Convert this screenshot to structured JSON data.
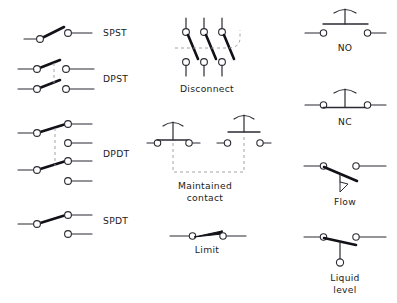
{
  "diagram": {
    "background_color": "#ffffff",
    "line_color": "#2b2b33",
    "blade_color": "#111118",
    "linkage_color": "#9a9aa2",
    "label_color": "#1c1c22",
    "width": 397,
    "height": 303
  },
  "symbols": {
    "spst": {
      "label": "SPST",
      "name": "single-pole-single-throw",
      "poles": 1,
      "throws": 1,
      "state": "open",
      "terminals": 2,
      "label_x": 103,
      "label_y": 33,
      "label_align": "start"
    },
    "dpst": {
      "label": "DPST",
      "name": "double-pole-single-throw",
      "poles": 2,
      "throws": 1,
      "state": "open",
      "terminals": 4,
      "linkage": "dashed",
      "label_x": 103,
      "label_y": 82,
      "label_align": "start"
    },
    "dpdt": {
      "label": "DPDT",
      "name": "double-pole-double-throw",
      "poles": 2,
      "throws": 2,
      "state": "closed-upper",
      "terminals": 6,
      "linkage": "dashed",
      "label_x": 103,
      "label_y": 157,
      "label_align": "start"
    },
    "spdt": {
      "label": "SPDT",
      "name": "single-pole-double-throw",
      "poles": 1,
      "throws": 2,
      "state": "closed-upper",
      "terminals": 3,
      "label_x": 103,
      "label_y": 224,
      "label_align": "start"
    },
    "disconnect": {
      "label": "Disconnect",
      "name": "three-pole-disconnect",
      "poles": 3,
      "state": "open",
      "linkage": "dashed",
      "label_x": 207,
      "label_y": 92,
      "label_align": "middle"
    },
    "maintained_contact": {
      "label_line1": "Maintained",
      "label_line2": "contact",
      "name": "maintained-contact",
      "left_contact": "normally-closed",
      "right_contact": "normally-open",
      "linkage": "dashed",
      "label_x": 205,
      "label_y": 189,
      "label_x2": 205,
      "label_y2": 200,
      "label_align": "middle"
    },
    "limit": {
      "label": "Limit",
      "name": "limit-switch",
      "state": "closed",
      "label_x": 207,
      "label_y": 253,
      "label_align": "middle"
    },
    "no": {
      "label": "NO",
      "name": "normally-open-pushbutton",
      "state": "open",
      "label_x": 345,
      "label_y": 51,
      "label_align": "middle"
    },
    "nc": {
      "label": "NC",
      "name": "normally-closed-pushbutton",
      "state": "closed",
      "label_x": 345,
      "label_y": 125,
      "label_align": "middle"
    },
    "flow": {
      "label": "Flow",
      "name": "flow-switch",
      "state": "open",
      "actuator": "flow-paddle",
      "label_x": 345,
      "label_y": 205,
      "label_align": "middle"
    },
    "liquid_level": {
      "label_line1": "Liquid",
      "label_line2": "level",
      "name": "liquid-level-switch",
      "state": "closed",
      "actuator": "float-ball",
      "label_x": 345,
      "label_y": 281,
      "label_x2": 345,
      "label_y2": 293,
      "label_align": "middle"
    }
  }
}
